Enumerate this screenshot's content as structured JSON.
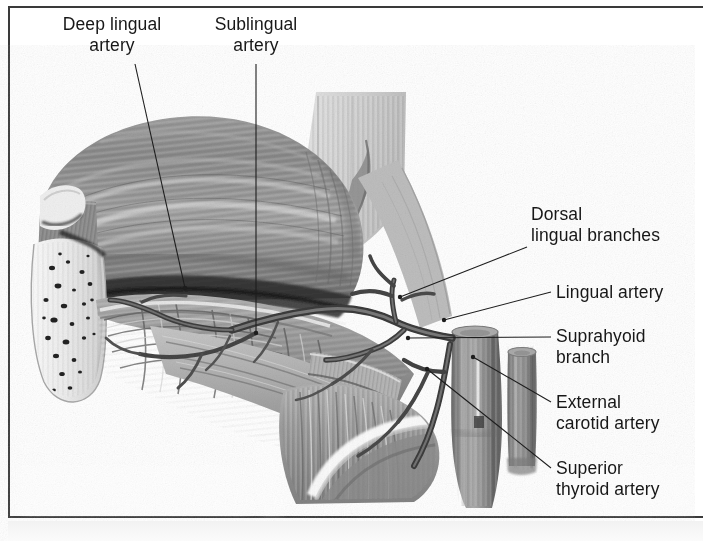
{
  "figure": {
    "background_color": "#ffffff",
    "frame_color": "#3a3a3a",
    "ink_color": "#171717"
  },
  "labels": [
    {
      "id": "deep-lingual-artery",
      "text": "Deep lingual\nartery",
      "align": "center",
      "x": 42,
      "y": 14,
      "width": 140
    },
    {
      "id": "sublingual-artery",
      "text": "Sublingual\nartery",
      "align": "center",
      "x": 196,
      "y": 14,
      "width": 120
    },
    {
      "id": "dorsal-lingual-branches",
      "text": "Dorsal\nlingual branches",
      "align": "left",
      "x": 531,
      "y": 204,
      "width": 164
    },
    {
      "id": "lingual-artery",
      "text": "Lingual artery",
      "align": "left",
      "x": 556,
      "y": 282,
      "width": 140
    },
    {
      "id": "suprahyoid-branch",
      "text": "Suprahyoid\nbranch",
      "align": "left",
      "x": 556,
      "y": 326,
      "width": 140
    },
    {
      "id": "external-carotid-artery",
      "text": "External\ncarotid artery",
      "align": "left",
      "x": 556,
      "y": 392,
      "width": 150
    },
    {
      "id": "superior-thyroid-artery",
      "text": "Superior\nthyroid artery",
      "align": "left",
      "x": 556,
      "y": 458,
      "width": 150
    }
  ],
  "leader_lines": [
    {
      "id": "leader-deep-lingual-artery",
      "x1": 135,
      "y1": 64,
      "x2": 185,
      "y2": 288,
      "dot": "end"
    },
    {
      "id": "leader-sublingual-artery",
      "x1": 256,
      "y1": 64,
      "x2": 256,
      "y2": 333,
      "dot": "end"
    },
    {
      "id": "leader-dorsal-lingual-branches",
      "x1": 527,
      "y1": 247,
      "x2": 400,
      "y2": 297,
      "dot": "end"
    },
    {
      "id": "leader-lingual-artery",
      "x1": 551,
      "y1": 292,
      "x2": 444,
      "y2": 320,
      "dot": "end"
    },
    {
      "id": "leader-suprahyoid-branch",
      "x1": 551,
      "y1": 337,
      "x2": 408,
      "y2": 338,
      "dot": "end"
    },
    {
      "id": "leader-external-carotid-artery",
      "x1": 551,
      "y1": 402,
      "x2": 473,
      "y2": 357,
      "dot": "end"
    },
    {
      "id": "leader-superior-thyroid-artery",
      "x1": 551,
      "y1": 468,
      "x2": 427,
      "y2": 369,
      "dot": "end"
    }
  ],
  "illustration": {
    "style": "grayscale-halftone-anatomical-drawing",
    "structures": [
      {
        "name": "tongue-body",
        "tone": "#8e8e8e"
      },
      {
        "name": "tongue-striations",
        "tone": "#c9c9c9"
      },
      {
        "name": "mandible-bone",
        "tone": "#efefef"
      },
      {
        "name": "trabecular-bone-texture",
        "tone": "#2b2b2b"
      },
      {
        "name": "soft-palate",
        "tone": "#d8d8d8"
      },
      {
        "name": "floor-of-mouth-muscles",
        "tone": "#a2a2a2"
      },
      {
        "name": "hyoid-bone",
        "tone": "#f4f4f4"
      },
      {
        "name": "external-carotid-trunk",
        "tone": "#8a8a8a"
      },
      {
        "name": "superior-thyroid-vessel",
        "tone": "#8a8a8a"
      },
      {
        "name": "arterial-branches",
        "tone": "#6a6a6a"
      }
    ]
  }
}
